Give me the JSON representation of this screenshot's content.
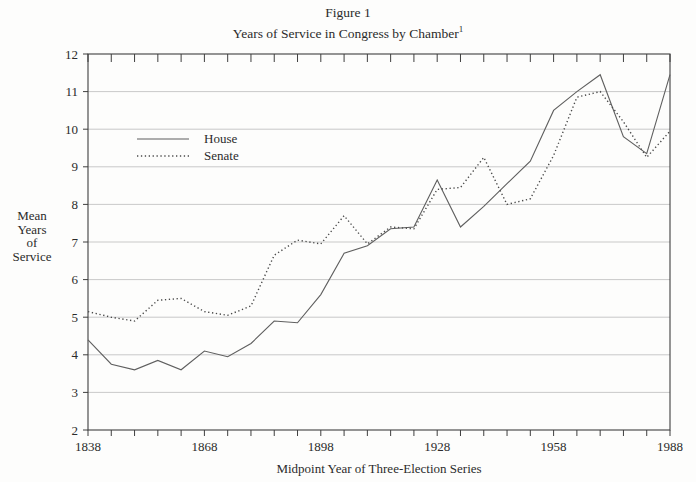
{
  "title": {
    "line1": "Figure 1",
    "line2": "Years of Service in Congress by Chamber",
    "line2_superscript": "1"
  },
  "legend": {
    "items": [
      {
        "label": "House",
        "style": "solid"
      },
      {
        "label": "Senate",
        "style": "dotted"
      }
    ]
  },
  "chart_data": {
    "type": "line",
    "xlabel": "Midpoint Year of Three-Election Series",
    "ylabel": "Mean Years of Service",
    "ylabel_lines": [
      "Mean",
      "Years",
      "of",
      "Service"
    ],
    "xlim": [
      1838,
      1988
    ],
    "ylim": [
      2,
      12
    ],
    "grid": "horizontal",
    "legend_position": "upper-left-inside",
    "x_ticks_major": [
      1838,
      1868,
      1898,
      1928,
      1958,
      1988
    ],
    "x_minor_tick_step_years": 6,
    "y_ticks": [
      2,
      3,
      4,
      5,
      6,
      7,
      8,
      9,
      10,
      11,
      12
    ],
    "x": [
      1838,
      1844,
      1850,
      1856,
      1862,
      1868,
      1874,
      1880,
      1886,
      1892,
      1898,
      1904,
      1910,
      1916,
      1922,
      1928,
      1934,
      1940,
      1946,
      1952,
      1958,
      1964,
      1970,
      1976,
      1982,
      1988
    ],
    "series": [
      {
        "name": "House",
        "style": "solid",
        "values": [
          4.4,
          3.75,
          3.6,
          3.85,
          3.6,
          4.1,
          3.95,
          4.3,
          4.9,
          4.85,
          5.6,
          6.7,
          6.9,
          7.35,
          7.4,
          8.65,
          7.4,
          7.95,
          8.55,
          9.15,
          10.5,
          11.0,
          11.45,
          9.8,
          9.35,
          11.45
        ]
      },
      {
        "name": "Senate",
        "style": "dotted",
        "values": [
          5.15,
          5.0,
          4.9,
          5.45,
          5.5,
          5.15,
          5.05,
          5.3,
          6.65,
          7.05,
          6.95,
          7.7,
          6.95,
          7.4,
          7.35,
          8.4,
          8.45,
          9.25,
          8.0,
          8.15,
          9.3,
          10.85,
          11.0,
          10.2,
          9.25,
          9.95
        ]
      }
    ],
    "colors": {
      "frame": "#3f3f3f",
      "gridline": "#c3c3c3",
      "house_line": "#5f5f5f",
      "senate_line": "#4a4a4a",
      "text": "#2b2b2b"
    }
  }
}
